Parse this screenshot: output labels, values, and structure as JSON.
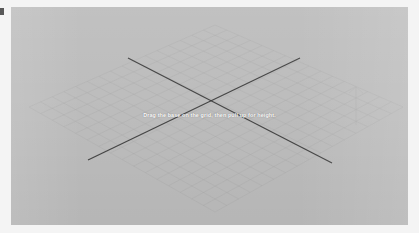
{
  "app": {
    "title": "3D Grid Placement Viewport",
    "background_color": "#bdbdbd",
    "page_background_color": "#f4f4f4"
  },
  "viewport": {
    "name": "isometric-grid-viewport",
    "width": 397,
    "height": 218,
    "grid": {
      "name": "isometric-floor-grid",
      "line_color": "#a7a7a7",
      "cells_u": 16,
      "cells_v": 16,
      "visible": true
    },
    "axes": {
      "name": "crossing-axis-lines",
      "color": "#3a3a3a",
      "line_width": 1.2,
      "lines": [
        {
          "name": "axis-line-primary",
          "x1": 117,
          "y1": 51,
          "x2": 321,
          "y2": 156
        },
        {
          "name": "axis-line-secondary",
          "x1": 77,
          "y1": 153,
          "x2": 289,
          "y2": 51
        }
      ]
    },
    "height_guide": {
      "name": "vertical-height-guide",
      "color": "#b0b0b0",
      "x": 345,
      "y_top": 80,
      "y_bottom": 118,
      "visible": true
    }
  },
  "hint": {
    "text": "Drag the base on the grid, then pull up for height.",
    "color": "#ffffff"
  },
  "edge_marker": {
    "name": "left-edge-marker",
    "color": "#3c3c3c"
  }
}
